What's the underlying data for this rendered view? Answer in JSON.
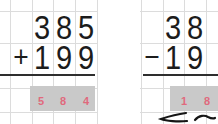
{
  "worksheet": {
    "problems": [
      {
        "operation": "addition",
        "operator": "+",
        "top_row": [
          "3",
          "8",
          "5"
        ],
        "bottom_row": [
          "1",
          "9",
          "9"
        ],
        "answer_row": [
          "5",
          "8",
          "4"
        ]
      },
      {
        "operation": "subtraction",
        "operator": "−",
        "top_row": [
          "3",
          "8"
        ],
        "bottom_row": [
          "1",
          "9"
        ],
        "answer_row": [
          "1",
          "8"
        ],
        "handwriting_marks": [
          "pencil-squiggle",
          "pencil-dash"
        ]
      }
    ],
    "colors": {
      "grid_line": "#dcdcdc",
      "digit": "#1c1c1c",
      "rule_line": "#2e2e2e",
      "answer_box": "#c9c9c9",
      "answer_digit": "#e0697d",
      "handwriting": "#151515"
    }
  }
}
